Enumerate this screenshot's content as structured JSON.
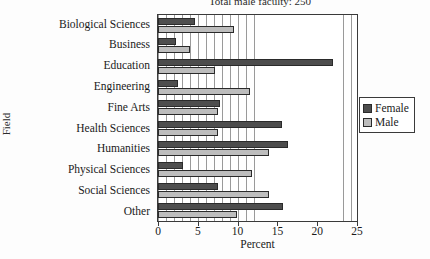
{
  "chart_data": {
    "type": "bar",
    "orientation": "horizontal",
    "title": "Total male faculty:  250",
    "xlabel": "Percent",
    "ylabel": "Field",
    "xlim": [
      0,
      25
    ],
    "xticks": [
      0,
      5,
      10,
      15,
      20,
      25
    ],
    "xtick_labels": [
      "0",
      "5",
      "10",
      "15",
      "20",
      "25"
    ],
    "grid": true,
    "grid_axis": "x",
    "grid_interval": 1,
    "legend_position": "right",
    "categories": [
      "Biological Sciences",
      "Business",
      "Education",
      "Engineering",
      "Fine Arts",
      "Health Sciences",
      "Humanities",
      "Physical Sciences",
      "Social Sciences",
      "Other"
    ],
    "series": [
      {
        "name": "Female",
        "color": "#4d4d4d",
        "values": [
          4.7,
          2.2,
          22.0,
          2.5,
          7.8,
          15.6,
          16.3,
          3.1,
          7.6,
          15.7
        ]
      },
      {
        "name": "Male",
        "color": "#bdbdbd",
        "values": [
          9.6,
          4.0,
          7.2,
          11.6,
          7.5,
          7.5,
          14.0,
          11.8,
          14.0,
          9.9
        ]
      }
    ]
  },
  "legend": {
    "entries": [
      {
        "label": "Female",
        "color": "#4d4d4d"
      },
      {
        "label": "Male",
        "color": "#bdbdbd"
      }
    ]
  }
}
